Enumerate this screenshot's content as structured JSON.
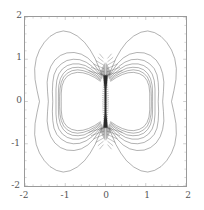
{
  "figure": {
    "background": "#ffffff",
    "frame_color": "#9a9a9a",
    "contour_color": "#4a4a4a",
    "dense_color": "#2b2b2b",
    "tick_color": "#8a8a8a"
  },
  "chart_data": {
    "type": "contour",
    "title": "",
    "xlabel": "",
    "ylabel": "",
    "xlim": [
      -2,
      2
    ],
    "ylim": [
      -2,
      2
    ],
    "grid": false,
    "legend": null,
    "x_ticks": [
      -2,
      -1,
      0,
      1,
      2
    ],
    "y_ticks": [
      -2,
      -1,
      0,
      1,
      2
    ],
    "x_tick_labels": [
      "-2",
      "-1",
      "0",
      "1",
      "2"
    ],
    "y_tick_labels": [
      "-2",
      "-1",
      "0",
      "1",
      "2"
    ],
    "symmetry": [
      "mirror-x",
      "mirror-y"
    ],
    "n_levels": 7,
    "levels": [
      0.2,
      0.4,
      0.6,
      0.8,
      1.0,
      1.4,
      2.0
    ],
    "lobe_centers": [
      [
        -0.75,
        0.0
      ],
      [
        0.75,
        0.0
      ]
    ],
    "outer_contour_extent": {
      "x": 1.75,
      "y": 1.68
    },
    "singularity_band": {
      "x": 0.0,
      "y_min": -0.62,
      "y_max": 0.62
    },
    "contours": [
      {
        "level": 0.2,
        "label": "outermost",
        "right_lobe": [
          [
            0.07,
            0.6
          ],
          [
            0.16,
            0.8
          ],
          [
            0.26,
            1.02
          ],
          [
            0.38,
            1.22
          ],
          [
            0.52,
            1.4
          ],
          [
            0.7,
            1.55
          ],
          [
            0.88,
            1.64
          ],
          [
            1.05,
            1.67
          ],
          [
            1.22,
            1.63
          ],
          [
            1.38,
            1.54
          ],
          [
            1.52,
            1.4
          ],
          [
            1.64,
            1.22
          ],
          [
            1.72,
            1.02
          ],
          [
            1.76,
            0.78
          ],
          [
            1.75,
            0.52
          ],
          [
            1.7,
            0.26
          ],
          [
            1.64,
            0.0
          ],
          [
            1.7,
            -0.26
          ],
          [
            1.75,
            -0.52
          ],
          [
            1.76,
            -0.78
          ],
          [
            1.72,
            -1.02
          ],
          [
            1.64,
            -1.22
          ],
          [
            1.52,
            -1.4
          ],
          [
            1.38,
            -1.54
          ],
          [
            1.22,
            -1.63
          ],
          [
            1.05,
            -1.67
          ],
          [
            0.88,
            -1.64
          ],
          [
            0.7,
            -1.55
          ],
          [
            0.52,
            -1.4
          ],
          [
            0.38,
            -1.22
          ],
          [
            0.26,
            -1.02
          ],
          [
            0.16,
            -0.8
          ],
          [
            0.07,
            -0.6
          ]
        ]
      },
      {
        "level": 0.4,
        "label": "second",
        "right_lobe": [
          [
            0.08,
            0.58
          ],
          [
            0.18,
            0.74
          ],
          [
            0.3,
            0.9
          ],
          [
            0.44,
            1.03
          ],
          [
            0.6,
            1.12
          ],
          [
            0.78,
            1.16
          ],
          [
            0.96,
            1.15
          ],
          [
            1.12,
            1.09
          ],
          [
            1.26,
            0.98
          ],
          [
            1.36,
            0.83
          ],
          [
            1.42,
            0.66
          ],
          [
            1.45,
            0.46
          ],
          [
            1.44,
            0.24
          ],
          [
            1.42,
            0.0
          ],
          [
            1.44,
            -0.24
          ],
          [
            1.45,
            -0.46
          ],
          [
            1.42,
            -0.66
          ],
          [
            1.36,
            -0.83
          ],
          [
            1.26,
            -0.98
          ],
          [
            1.12,
            -1.09
          ],
          [
            0.96,
            -1.15
          ],
          [
            0.78,
            -1.16
          ],
          [
            0.6,
            -1.12
          ],
          [
            0.44,
            -1.03
          ],
          [
            0.3,
            -0.9
          ],
          [
            0.18,
            -0.74
          ],
          [
            0.08,
            -0.58
          ]
        ]
      },
      {
        "level": 0.6,
        "label": "third",
        "right_lobe": [
          [
            0.09,
            0.56
          ],
          [
            0.2,
            0.7
          ],
          [
            0.33,
            0.83
          ],
          [
            0.48,
            0.93
          ],
          [
            0.64,
            0.99
          ],
          [
            0.8,
            1.0
          ],
          [
            0.96,
            0.97
          ],
          [
            1.1,
            0.89
          ],
          [
            1.21,
            0.78
          ],
          [
            1.28,
            0.63
          ],
          [
            1.31,
            0.45
          ],
          [
            1.32,
            0.23
          ],
          [
            1.31,
            0.0
          ],
          [
            1.32,
            -0.23
          ],
          [
            1.31,
            -0.45
          ],
          [
            1.28,
            -0.63
          ],
          [
            1.21,
            -0.78
          ],
          [
            1.1,
            -0.89
          ],
          [
            0.96,
            -0.97
          ],
          [
            0.8,
            -1.0
          ],
          [
            0.64,
            -0.99
          ],
          [
            0.48,
            -0.93
          ],
          [
            0.33,
            -0.83
          ],
          [
            0.2,
            -0.7
          ],
          [
            0.09,
            -0.56
          ]
        ]
      },
      {
        "level": 0.8,
        "label": "fourth",
        "right_lobe": [
          [
            0.1,
            0.54
          ],
          [
            0.22,
            0.66
          ],
          [
            0.36,
            0.77
          ],
          [
            0.5,
            0.85
          ],
          [
            0.66,
            0.89
          ],
          [
            0.81,
            0.89
          ],
          [
            0.95,
            0.85
          ],
          [
            1.07,
            0.77
          ],
          [
            1.16,
            0.65
          ],
          [
            1.21,
            0.5
          ],
          [
            1.23,
            0.3
          ],
          [
            1.23,
            0.08
          ],
          [
            1.23,
            -0.08
          ],
          [
            1.23,
            -0.3
          ],
          [
            1.21,
            -0.5
          ],
          [
            1.16,
            -0.65
          ],
          [
            1.07,
            -0.77
          ],
          [
            0.95,
            -0.85
          ],
          [
            0.81,
            -0.89
          ],
          [
            0.66,
            -0.89
          ],
          [
            0.5,
            -0.85
          ],
          [
            0.36,
            -0.77
          ],
          [
            0.22,
            -0.66
          ],
          [
            0.1,
            -0.54
          ]
        ]
      },
      {
        "level": 1.0,
        "label": "fifth",
        "right_lobe": [
          [
            0.11,
            0.52
          ],
          [
            0.24,
            0.63
          ],
          [
            0.38,
            0.72
          ],
          [
            0.53,
            0.79
          ],
          [
            0.68,
            0.81
          ],
          [
            0.82,
            0.8
          ],
          [
            0.95,
            0.75
          ],
          [
            1.05,
            0.66
          ],
          [
            1.12,
            0.54
          ],
          [
            1.16,
            0.38
          ],
          [
            1.17,
            0.2
          ],
          [
            1.17,
            0.0
          ],
          [
            1.17,
            -0.2
          ],
          [
            1.16,
            -0.38
          ],
          [
            1.12,
            -0.54
          ],
          [
            1.05,
            -0.66
          ],
          [
            0.95,
            -0.75
          ],
          [
            0.82,
            -0.8
          ],
          [
            0.68,
            -0.81
          ],
          [
            0.53,
            -0.79
          ],
          [
            0.38,
            -0.72
          ],
          [
            0.24,
            -0.63
          ],
          [
            0.11,
            -0.52
          ]
        ]
      },
      {
        "level": 1.4,
        "label": "sixth",
        "right_lobe": [
          [
            0.12,
            0.5
          ],
          [
            0.25,
            0.6
          ],
          [
            0.4,
            0.68
          ],
          [
            0.55,
            0.73
          ],
          [
            0.69,
            0.75
          ],
          [
            0.83,
            0.73
          ],
          [
            0.95,
            0.67
          ],
          [
            1.04,
            0.58
          ],
          [
            1.1,
            0.45
          ],
          [
            1.13,
            0.3
          ],
          [
            1.14,
            0.12
          ],
          [
            1.14,
            -0.12
          ],
          [
            1.13,
            -0.3
          ],
          [
            1.1,
            -0.45
          ],
          [
            1.04,
            -0.58
          ],
          [
            0.95,
            -0.67
          ],
          [
            0.83,
            -0.73
          ],
          [
            0.69,
            -0.75
          ],
          [
            0.55,
            -0.73
          ],
          [
            0.4,
            -0.68
          ],
          [
            0.25,
            -0.6
          ],
          [
            0.12,
            -0.5
          ]
        ]
      },
      {
        "level": 2.0,
        "label": "innermost",
        "right_lobe": [
          [
            0.13,
            0.48
          ],
          [
            0.27,
            0.57
          ],
          [
            0.42,
            0.64
          ],
          [
            0.56,
            0.68
          ],
          [
            0.7,
            0.69
          ],
          [
            0.84,
            0.66
          ],
          [
            0.95,
            0.6
          ],
          [
            1.03,
            0.5
          ],
          [
            1.08,
            0.37
          ],
          [
            1.1,
            0.2
          ],
          [
            1.1,
            0.0
          ],
          [
            1.1,
            -0.2
          ],
          [
            1.08,
            -0.37
          ],
          [
            1.03,
            -0.5
          ],
          [
            0.95,
            -0.6
          ],
          [
            0.84,
            -0.66
          ],
          [
            0.7,
            -0.69
          ],
          [
            0.56,
            -0.68
          ],
          [
            0.42,
            -0.64
          ],
          [
            0.27,
            -0.57
          ],
          [
            0.13,
            -0.48
          ]
        ]
      }
    ],
    "axial_fan_lines": [
      {
        "y": 0.62,
        "x_from": 0.02,
        "x_to": 0.42
      },
      {
        "y": 0.7,
        "x_from": 0.03,
        "x_to": 0.36
      },
      {
        "y": 0.78,
        "x_from": 0.04,
        "x_to": 0.3
      },
      {
        "y": 0.86,
        "x_from": 0.04,
        "x_to": 0.24
      },
      {
        "y": 0.94,
        "x_from": 0.05,
        "x_to": 0.19
      },
      {
        "y": 1.02,
        "x_from": 0.05,
        "x_to": 0.15
      }
    ]
  },
  "axis": {
    "y_labels": [
      "2",
      "1",
      "0",
      "-1",
      "-2"
    ],
    "x_labels": [
      "-2",
      "-1",
      "0",
      "1",
      "2"
    ]
  }
}
